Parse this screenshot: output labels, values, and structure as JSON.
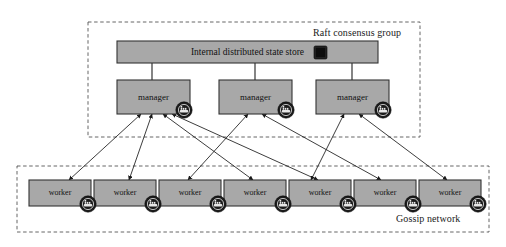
{
  "figure": {
    "background": "#ffffff"
  },
  "colors": {
    "node_fill": "#a8a8a8",
    "node_stroke": "#333333",
    "dashed_stroke": "#555555",
    "arrow_stroke": "#1a1a1a",
    "badge_fill": "#1c1c1c",
    "badge_glyph": "#e8e8e8",
    "db_icon_fill": "#262626",
    "text": "#111111"
  },
  "groups": [
    {
      "id": "raft",
      "label": "Raft consensus group",
      "label_x": 313,
      "label_y": 27,
      "x": 88,
      "y": 22,
      "w": 332,
      "h": 115
    },
    {
      "id": "gossip",
      "label": "Gossip network",
      "label_x": 396,
      "label_y": 213,
      "x": 17,
      "y": 166,
      "w": 472,
      "h": 66
    }
  ],
  "state_store": {
    "label": "Internal distributed state store",
    "x": 117,
    "y": 41,
    "w": 261,
    "h": 22,
    "icon": "database-icon",
    "icon_x": 314,
    "icon_y": 46,
    "icon_w": 13,
    "icon_h": 13
  },
  "managers": [
    {
      "label": "manager",
      "x": 117,
      "y": 80,
      "w": 73,
      "h": 34,
      "badge": "docker-whale-icon",
      "badge_cx": 184,
      "badge_cy": 110
    },
    {
      "label": "manager",
      "x": 219,
      "y": 80,
      "w": 73,
      "h": 34,
      "badge": "docker-whale-icon",
      "badge_cx": 286,
      "badge_cy": 110
    },
    {
      "label": "manager",
      "x": 316,
      "y": 80,
      "w": 73,
      "h": 34,
      "badge": "docker-whale-icon",
      "badge_cx": 383,
      "badge_cy": 110
    }
  ],
  "connectors": [
    {
      "from": "state-store",
      "to": "manager-1",
      "x": 152,
      "y1": 63,
      "y2": 80
    },
    {
      "from": "state-store",
      "to": "manager-2",
      "x": 255,
      "y1": 63,
      "y2": 80
    },
    {
      "from": "state-store",
      "to": "manager-3",
      "x": 352,
      "y1": 63,
      "y2": 80
    }
  ],
  "workers": [
    {
      "label": "worker",
      "x": 29,
      "y": 180,
      "w": 62,
      "h": 26,
      "badge": "docker-whale-icon",
      "badge_cx": 88,
      "badge_cy": 204
    },
    {
      "label": "worker",
      "x": 94,
      "y": 180,
      "w": 62,
      "h": 26,
      "badge": "docker-whale-icon",
      "badge_cx": 153,
      "badge_cy": 204
    },
    {
      "label": "worker",
      "x": 159,
      "y": 180,
      "w": 62,
      "h": 26,
      "badge": "docker-whale-icon",
      "badge_cx": 218,
      "badge_cy": 204
    },
    {
      "label": "worker",
      "x": 224,
      "y": 180,
      "w": 62,
      "h": 26,
      "badge": "docker-whale-icon",
      "badge_cx": 283,
      "badge_cy": 204
    },
    {
      "label": "worker",
      "x": 289,
      "y": 180,
      "w": 62,
      "h": 26,
      "badge": "docker-whale-icon",
      "badge_cx": 348,
      "badge_cy": 204
    },
    {
      "label": "worker",
      "x": 354,
      "y": 180,
      "w": 62,
      "h": 26,
      "badge": "docker-whale-icon",
      "badge_cx": 413,
      "badge_cy": 204
    },
    {
      "label": "worker",
      "x": 419,
      "y": 180,
      "w": 62,
      "h": 26,
      "badge": "docker-whale-icon",
      "badge_cx": 478,
      "badge_cy": 204
    }
  ],
  "links": [
    {
      "manager": 1,
      "worker": 1,
      "mx": 141,
      "my": 114,
      "wx": 69,
      "wy": 180
    },
    {
      "manager": 1,
      "worker": 2,
      "mx": 152,
      "my": 114,
      "wx": 129,
      "wy": 180
    },
    {
      "manager": 1,
      "worker": 4,
      "mx": 163,
      "my": 114,
      "wx": 253,
      "wy": 180
    },
    {
      "manager": 1,
      "worker": 5,
      "mx": 172,
      "my": 114,
      "wx": 318,
      "wy": 180
    },
    {
      "manager": 2,
      "worker": 3,
      "mx": 248,
      "my": 114,
      "wx": 188,
      "wy": 180
    },
    {
      "manager": 2,
      "worker": 6,
      "mx": 262,
      "my": 114,
      "wx": 381,
      "wy": 180
    },
    {
      "manager": 3,
      "worker": 5,
      "mx": 344,
      "my": 114,
      "wx": 311,
      "wy": 180
    },
    {
      "manager": 3,
      "worker": 7,
      "mx": 359,
      "my": 114,
      "wx": 447,
      "wy": 180
    }
  ]
}
